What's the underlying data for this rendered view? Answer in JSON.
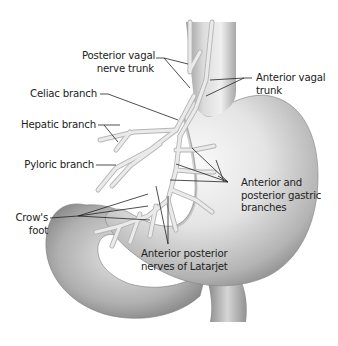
{
  "diagram": {
    "colors": {
      "background": "#ffffff",
      "organ_light": "#f2f2f2",
      "organ_mid": "#c8c8c8",
      "organ_dark": "#8a8a8a",
      "nerve": "#e6e6e6",
      "nerve_outline": "#b5b5b5",
      "leader_line": "#222222",
      "text": "#222222"
    },
    "labels": {
      "posterior_vagal": {
        "line1": "Posterior vagal",
        "line2": "nerve trunk"
      },
      "anterior_vagal": {
        "line1": "Anterior vagal",
        "line2": "trunk"
      },
      "celiac": "Celiac branch",
      "hepatic": "Hepatic branch",
      "pyloric": "Pyloric branch",
      "gastric": {
        "line1": "Anterior and",
        "line2": "posterior gastric",
        "line3": "branches"
      },
      "crows_foot": {
        "line1": "Crow's",
        "line2": "foot"
      },
      "latarjet": {
        "line1": "Anterior posterior",
        "line2": "nerves of Latarjet"
      }
    }
  }
}
